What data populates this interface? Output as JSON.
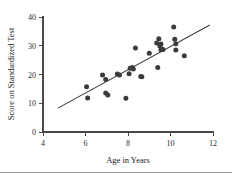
{
  "chart_data": {
    "type": "scatter",
    "title": "",
    "xlabel": "Age in Years",
    "ylabel": "Score on Standardized Test",
    "xlim": [
      4,
      12
    ],
    "ylim": [
      0,
      40
    ],
    "xticks": [
      4,
      6,
      8,
      10,
      12
    ],
    "yticks": [
      0,
      10,
      20,
      30,
      40
    ],
    "grid": false,
    "legend": "none",
    "marker": "filled-circle",
    "marker_color": "#3b3b3b",
    "points": [
      {
        "x": 6.05,
        "y": 15.7
      },
      {
        "x": 6.1,
        "y": 11.8
      },
      {
        "x": 6.8,
        "y": 19.8
      },
      {
        "x": 6.95,
        "y": 18.3
      },
      {
        "x": 6.95,
        "y": 13.6
      },
      {
        "x": 7.05,
        "y": 12.9
      },
      {
        "x": 7.5,
        "y": 20.2
      },
      {
        "x": 7.6,
        "y": 19.8
      },
      {
        "x": 7.9,
        "y": 11.7
      },
      {
        "x": 8.05,
        "y": 20.3
      },
      {
        "x": 8.1,
        "y": 22.2
      },
      {
        "x": 8.2,
        "y": 22.4
      },
      {
        "x": 8.25,
        "y": 21.9
      },
      {
        "x": 8.35,
        "y": 29.2
      },
      {
        "x": 8.6,
        "y": 19.3
      },
      {
        "x": 8.65,
        "y": 19.2
      },
      {
        "x": 9.0,
        "y": 27.4
      },
      {
        "x": 9.35,
        "y": 31.0
      },
      {
        "x": 9.4,
        "y": 22.4
      },
      {
        "x": 9.45,
        "y": 32.4
      },
      {
        "x": 9.5,
        "y": 29.9
      },
      {
        "x": 9.55,
        "y": 28.6
      },
      {
        "x": 9.55,
        "y": 30.6
      },
      {
        "x": 9.6,
        "y": 28.8
      },
      {
        "x": 9.65,
        "y": 28.7
      },
      {
        "x": 10.15,
        "y": 36.5
      },
      {
        "x": 10.2,
        "y": 32.3
      },
      {
        "x": 10.25,
        "y": 30.7
      },
      {
        "x": 10.25,
        "y": 28.5
      },
      {
        "x": 10.65,
        "y": 26.5
      }
    ],
    "fit_line": {
      "type": "linear-regression",
      "x_start": 4.7,
      "y_start": 8.3,
      "x_end": 11.85,
      "y_end": 37.2
    }
  },
  "axes": {
    "x_tick_labels": [
      "4",
      "6",
      "8",
      "10",
      "12"
    ],
    "y_tick_labels": [
      "0",
      "10",
      "20",
      "30",
      "40"
    ],
    "x_axis_title": "Age in Years",
    "y_axis_title": "Score on Standardized Test"
  }
}
